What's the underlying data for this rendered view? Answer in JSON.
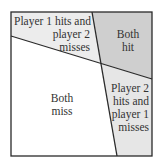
{
  "diagram": {
    "title": "",
    "regions": [
      {
        "id": "p1-hits-p2-misses",
        "lines": [
          "Player 1 hits and",
          "player 2",
          "misses"
        ],
        "fill": "#ececec"
      },
      {
        "id": "both-hit",
        "lines": [
          "Both",
          "hit"
        ],
        "fill": "#cfcfcf"
      },
      {
        "id": "both-miss",
        "lines": [
          "Both",
          "miss"
        ],
        "fill": "#ffffff"
      },
      {
        "id": "p2-hits-p1-misses",
        "lines": [
          "Player 2",
          "hits and",
          "player 1",
          "misses"
        ],
        "fill": "#e6e6e6"
      }
    ],
    "colors": {
      "border": "#2a2a2a",
      "text": "#333333"
    }
  }
}
